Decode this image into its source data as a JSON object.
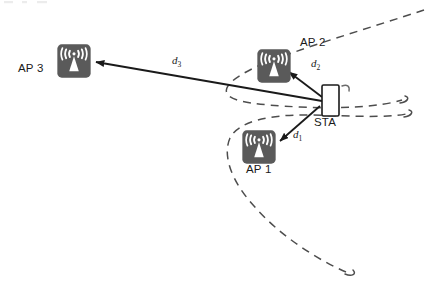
{
  "diagram": {
    "background_color": "#ffffff",
    "icon_fill": "#5a5a5a",
    "icon_glyph_color": "#ffffff",
    "line_color": "#1a1a1a",
    "curve_color": "#4d4d4d"
  },
  "nodes": {
    "ap3": {
      "label": "AP 3",
      "icon": "wifi-access-point-icon",
      "x": 73,
      "y": 61,
      "label_x": 18,
      "label_y": 62
    },
    "ap2": {
      "label": "AP 2",
      "icon": "wifi-access-point-icon",
      "x": 274,
      "y": 66,
      "label_x": 300,
      "label_y": 44
    },
    "ap1": {
      "label": "AP 1",
      "icon": "wifi-access-point-icon",
      "x": 259,
      "y": 147,
      "label_x": 246,
      "label_y": 170
    },
    "sta": {
      "label": "STA",
      "icon": "mobile-station-icon",
      "x": 330,
      "y": 100,
      "label_x": 314,
      "label_y": 124
    }
  },
  "distances": [
    {
      "id": "d1",
      "label": "d",
      "subscript": "1",
      "from": "sta",
      "to": "ap1",
      "label_x": 293,
      "label_y": 134
    },
    {
      "id": "d2",
      "label": "d",
      "subscript": "2",
      "from": "sta",
      "to": "ap2",
      "label_x": 311,
      "label_y": 63
    },
    {
      "id": "d3",
      "label": "d",
      "subscript": "3",
      "from": "sta",
      "to": "ap3",
      "label_x": 172,
      "label_y": 60
    }
  ],
  "curves": [
    {
      "name": "hyperbola-upper",
      "style": "dashed"
    },
    {
      "name": "hyperbola-lower",
      "style": "dashed"
    }
  ]
}
